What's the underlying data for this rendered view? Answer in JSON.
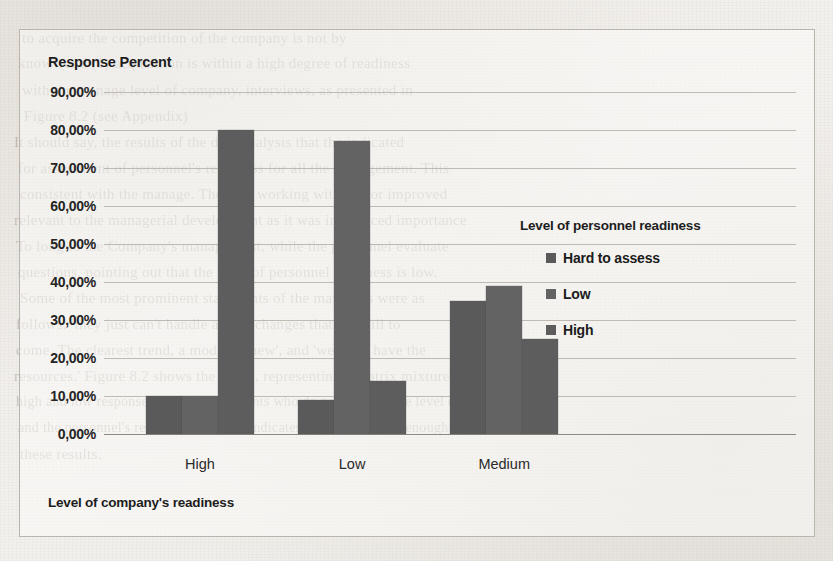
{
  "chart_data": {
    "type": "bar",
    "title": "",
    "ylabel": "Response Percent",
    "xlabel": "Level of company's readiness",
    "categories": [
      "High",
      "Low",
      "Medium"
    ],
    "ylim": [
      0,
      90
    ],
    "ytick_labels": [
      "0,00%",
      "10,00%",
      "20,00%",
      "30,00%",
      "40,00%",
      "50,00%",
      "60,00%",
      "70,00%",
      "80,00%",
      "90,00%"
    ],
    "ytick_values": [
      0,
      10,
      20,
      30,
      40,
      50,
      60,
      70,
      80,
      90
    ],
    "grid": true,
    "legend_position": "right",
    "legend_title": "Level of personnel readiness",
    "series": [
      {
        "name": "Hard to assess",
        "color": "#5a5a5a",
        "values": [
          10,
          9,
          35
        ]
      },
      {
        "name": "Low",
        "color": "#636363",
        "values": [
          10,
          77,
          39
        ]
      },
      {
        "name": "High",
        "color": "#5d5d5d",
        "values": [
          80,
          14,
          25
        ]
      }
    ]
  },
  "background_bleed": [
    {
      "text": "to acquire the competition of the company is not by",
      "x": 22,
      "y": 30,
      "size": 15
    },
    {
      "text": "know' (and (1) acquisition is within a high degree of readiness",
      "x": 18,
      "y": 55,
      "size": 15
    },
    {
      "text": "with the manage level of company, interviews, as presented in",
      "x": 22,
      "y": 82,
      "size": 15
    },
    {
      "text": "Figure 8.2 (see Appendix)",
      "x": 24,
      "y": 108,
      "size": 15
    },
    {
      "text": "It should say, the results of the data analysis that the indicated",
      "x": 14,
      "y": 134,
      "size": 15
    },
    {
      "text": "for assessment of personnel's readiness for all the management. This",
      "x": 18,
      "y": 160,
      "size": 15
    },
    {
      "text": "consistent with the manage. They (2) working without for improved",
      "x": 20,
      "y": 186,
      "size": 15
    },
    {
      "text": "relevant to the managerial development as it was introduced importance",
      "x": 14,
      "y": 212,
      "size": 15
    },
    {
      "text": "To long to the Company's management, while the personnel evaluate",
      "x": 16,
      "y": 238,
      "size": 15
    },
    {
      "text": "questions, pointing out that the level of personnel readiness is low.",
      "x": 18,
      "y": 264,
      "size": 15
    },
    {
      "text": "Some of the most prominent statements of the managers were as",
      "x": 20,
      "y": 290,
      "size": 15
    },
    {
      "text": "follows: 'they just can't handle all the changes that are still to",
      "x": 16,
      "y": 316,
      "size": 15
    },
    {
      "text": "come. The clearest trend, a model of new', and 'we don't have the",
      "x": 16,
      "y": 342,
      "size": 15
    },
    {
      "text": "resources.'  Figure 8.2 shows the graph, representing a matrix mixture of",
      "x": 14,
      "y": 368,
      "size": 15
    },
    {
      "text": "high and low response rates of respondents who do not indicate the level of company",
      "x": 16,
      "y": 394,
      "size": 14
    },
    {
      "text": "and the personnel's readiness, but only indicates that it is not low enough.",
      "x": 18,
      "y": 420,
      "size": 14
    },
    {
      "text": "these results.",
      "x": 20,
      "y": 446,
      "size": 15
    }
  ]
}
